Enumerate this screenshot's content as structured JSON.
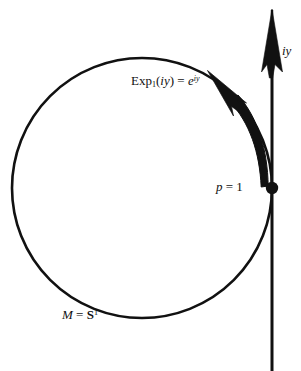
{
  "figure": {
    "background_color": "#ffffff",
    "ink_color": "#111111",
    "width": 301,
    "height": 371
  },
  "labels": {
    "exponential_map": {
      "full_text": "Exp1(iy) = e^{iy}",
      "function_name": "Exp",
      "subscript": "1",
      "argument_open": "(",
      "argument": "iy",
      "argument_close": ")",
      "equals": "=",
      "base": "e",
      "exponent": "iy"
    },
    "tangent_axis": {
      "full_text": "iy",
      "text": "iy"
    },
    "base_point": {
      "full_text": "p = 1",
      "variable": "p",
      "equals": "=",
      "value": "1"
    },
    "manifold": {
      "full_text": "M = S1",
      "variable": "M",
      "equals": "=",
      "space": "S",
      "dimension": "1"
    }
  },
  "geometry": {
    "circle": {
      "center_x": 142,
      "center_y": 188,
      "radius": 130,
      "stroke_width": 2.6,
      "color": "#111111"
    },
    "vertical_axis": {
      "x": 272,
      "y_top": 8,
      "y_bottom": 371,
      "stroke_width": 3.0,
      "color": "#111111"
    },
    "base_point_dot": {
      "x": 272,
      "y": 188,
      "radius": 6.2,
      "color": "#111111"
    },
    "tangent_arrowhead": {
      "tip_x": 272,
      "tip_y": 9,
      "color": "#111111"
    },
    "curved_arrow": {
      "start_x": 272,
      "start_y": 188,
      "tip_x": 208,
      "tip_y": 70,
      "color": "#111111",
      "description": "tapering arc from base point counterclockwise along the circle"
    }
  }
}
